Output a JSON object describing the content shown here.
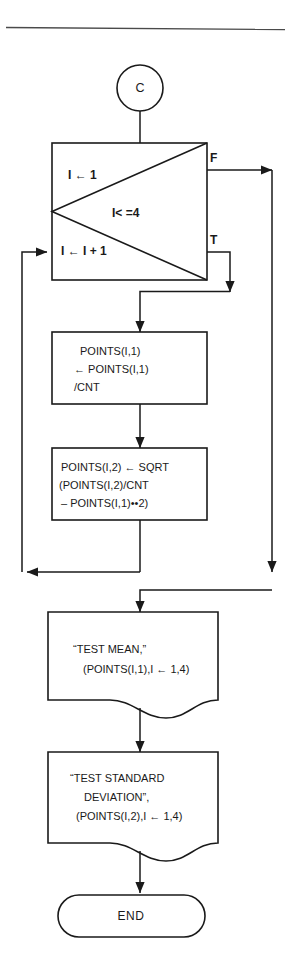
{
  "diagram": {
    "top_rule": true,
    "nodes": {
      "connector": {
        "type": "connector-circle",
        "label": "C"
      },
      "loop_box": {
        "type": "iteration-box",
        "init_label": "I ← 1",
        "condition_label": "I< =4",
        "increment_label": "I ← I + 1",
        "false_label": "F",
        "true_label": "T"
      },
      "process_mean": {
        "type": "process",
        "lines": [
          "POINTS(I,1)",
          "← POINTS(I,1)",
          "/CNT"
        ]
      },
      "process_stddev": {
        "type": "process",
        "lines": [
          "POINTS(I,2) ← SQRT",
          "(POINTS(I,2)/CNT",
          "– POINTS(I,1)••2)"
        ]
      },
      "output_mean": {
        "type": "document",
        "lines": [
          "“TEST MEAN,”",
          "(POINTS(I,1),I ← 1,4)"
        ]
      },
      "output_stddev": {
        "type": "document",
        "lines": [
          "“TEST STANDARD",
          "DEVIATION”,",
          "(POINTS(I,2),I ← 1,4)"
        ]
      },
      "terminal_end": {
        "type": "terminal",
        "label": "END"
      }
    },
    "colors": {
      "stroke": "#1a1a1a",
      "background": "#ffffff",
      "rule": "#4a4a4a"
    }
  }
}
